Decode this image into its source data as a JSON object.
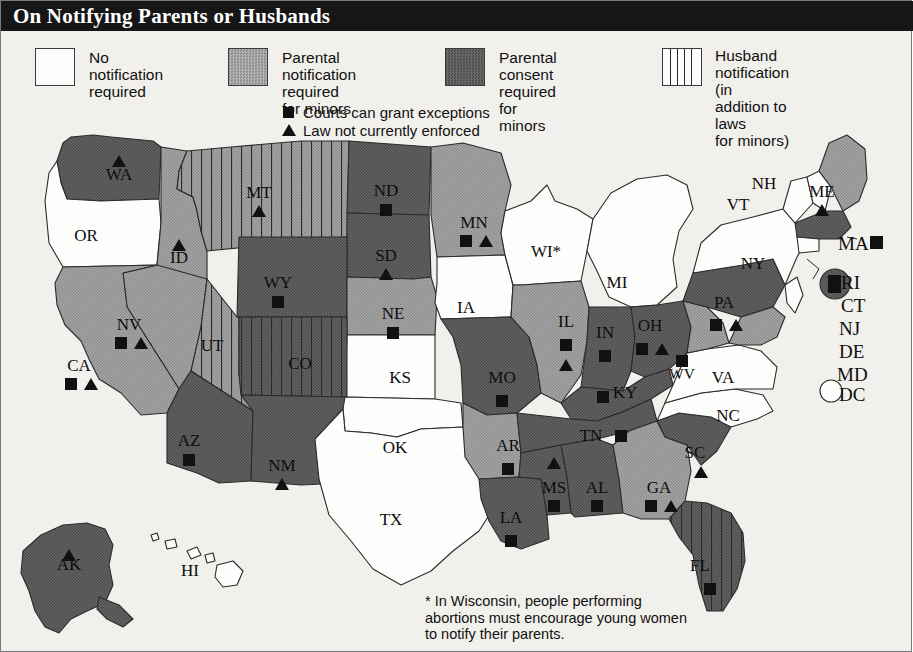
{
  "title": "On Notifying Parents or Husbands",
  "legend": {
    "categories": [
      {
        "id": "none",
        "swatch": "white",
        "line1": "No notification",
        "line2": "required"
      },
      {
        "id": "notify",
        "swatch": "light",
        "line1": "Parental notification",
        "line2": "required for minors"
      },
      {
        "id": "consent",
        "swatch": "dark",
        "line1": "Parental consent",
        "line2": "required for minors"
      },
      {
        "id": "husband",
        "swatch": "stripe",
        "line1": "Husband notification",
        "line2": "(in addition to laws",
        "line3": "for minors)"
      }
    ],
    "markers": [
      {
        "id": "square",
        "icon": "filled-square-icon",
        "label": "Courts can grant exceptions"
      },
      {
        "id": "triangle",
        "icon": "filled-triangle-icon",
        "label": "Law not currently enforced"
      }
    ]
  },
  "colors": {
    "title_bar": "#161616",
    "no_notification": "#fdfdfb",
    "parental_notification": "#9e9e9e",
    "parental_consent": "#5b5b5b",
    "marker": "#111111",
    "background": "#f2f0ec"
  },
  "footnote": "* In Wisconsin, people performing abortions must encourage young women to notify their parents.",
  "map_data": {
    "type": "choropleth-map",
    "region": "United States",
    "states": [
      {
        "code": "WA",
        "category": "consent",
        "markers": [
          "triangle"
        ],
        "x": 118,
        "y": 47
      },
      {
        "code": "OR",
        "category": "none",
        "markers": [],
        "x": 85,
        "y": 108
      },
      {
        "code": "ID",
        "category": "notify",
        "markers": [
          "triangle"
        ],
        "x": 178,
        "y": 130
      },
      {
        "code": "MT",
        "category": "notify",
        "husband": true,
        "markers": [
          "triangle"
        ],
        "x": 258,
        "y": 65
      },
      {
        "code": "ND",
        "category": "consent",
        "markers": [
          "square"
        ],
        "x": 385,
        "y": 63
      },
      {
        "code": "SD",
        "category": "consent",
        "markers": [
          "triangle"
        ],
        "x": 385,
        "y": 128
      },
      {
        "code": "WY",
        "category": "consent",
        "markers": [
          "square"
        ],
        "x": 277,
        "y": 155
      },
      {
        "code": "NV",
        "category": "notify",
        "markers": [
          "square",
          "triangle"
        ],
        "x": 128,
        "y": 197
      },
      {
        "code": "UT",
        "category": "notify",
        "husband": true,
        "markers": [],
        "x": 211,
        "y": 218
      },
      {
        "code": "CO",
        "category": "consent",
        "husband": true,
        "markers": [],
        "x": 299,
        "y": 236
      },
      {
        "code": "NE",
        "category": "notify",
        "markers": [
          "square"
        ],
        "x": 392,
        "y": 186
      },
      {
        "code": "KS",
        "category": "none",
        "markers": [],
        "x": 399,
        "y": 250
      },
      {
        "code": "CA",
        "category": "notify",
        "markers": [
          "square",
          "triangle"
        ],
        "x": 78,
        "y": 238
      },
      {
        "code": "AZ",
        "category": "consent",
        "markers": [
          "square"
        ],
        "x": 188,
        "y": 313
      },
      {
        "code": "NM",
        "category": "consent",
        "markers": [
          "triangle"
        ],
        "x": 281,
        "y": 338
      },
      {
        "code": "TX",
        "category": "none",
        "markers": [],
        "x": 390,
        "y": 392
      },
      {
        "code": "OK",
        "category": "none",
        "markers": [],
        "x": 394,
        "y": 320
      },
      {
        "code": "MN",
        "category": "notify",
        "markers": [
          "square",
          "triangle"
        ],
        "x": 473,
        "y": 95
      },
      {
        "code": "IA",
        "category": "none",
        "markers": [],
        "x": 465,
        "y": 180
      },
      {
        "code": "MO",
        "category": "consent",
        "markers": [
          "square"
        ],
        "x": 501,
        "y": 250
      },
      {
        "code": "AR",
        "category": "notify",
        "markers": [
          "square"
        ],
        "x": 507,
        "y": 318
      },
      {
        "code": "LA",
        "category": "consent",
        "markers": [
          "square"
        ],
        "x": 510,
        "y": 390
      },
      {
        "code": "WI",
        "category": "none",
        "markers": [],
        "asterisk": true,
        "x": 549,
        "y": 124
      },
      {
        "code": "MI",
        "category": "none",
        "markers": [],
        "x": 616,
        "y": 155
      },
      {
        "code": "IL",
        "category": "notify",
        "markers": [
          "square",
          "triangle"
        ],
        "x": 565,
        "y": 194
      },
      {
        "code": "IN",
        "category": "consent",
        "markers": [
          "square"
        ],
        "x": 604,
        "y": 205
      },
      {
        "code": "OH",
        "category": "consent",
        "markers": [
          "square",
          "triangle"
        ],
        "x": 649,
        "y": 198
      },
      {
        "code": "KY",
        "category": "consent",
        "markers": [
          "square"
        ],
        "x": 624,
        "y": 265
      },
      {
        "code": "TN",
        "category": "consent",
        "markers": [
          "square"
        ],
        "x": 590,
        "y": 308
      },
      {
        "code": "MS",
        "category": "consent",
        "markers": [
          "triangle",
          "square"
        ],
        "x": 553,
        "y": 360
      },
      {
        "code": "AL",
        "category": "consent",
        "markers": [
          "square"
        ],
        "x": 596,
        "y": 360
      },
      {
        "code": "GA",
        "category": "notify",
        "markers": [
          "square",
          "triangle"
        ],
        "x": 658,
        "y": 360
      },
      {
        "code": "SC",
        "category": "consent",
        "markers": [
          "triangle"
        ],
        "x": 694,
        "y": 325
      },
      {
        "code": "FL",
        "category": "consent",
        "husband": true,
        "markers": [
          "square"
        ],
        "x": 699,
        "y": 438
      },
      {
        "code": "NC",
        "category": "none",
        "markers": [],
        "x": 727,
        "y": 288
      },
      {
        "code": "VA",
        "category": "none",
        "markers": [],
        "x": 722,
        "y": 250
      },
      {
        "code": "WV",
        "category": "notify",
        "markers": [
          "square"
        ],
        "x": 681,
        "y": 246
      },
      {
        "code": "PA",
        "category": "consent",
        "markers": [
          "square",
          "triangle"
        ],
        "x": 723,
        "y": 175
      },
      {
        "code": "NY",
        "category": "none",
        "markers": [],
        "x": 752,
        "y": 136
      },
      {
        "code": "VT",
        "category": "none",
        "markers": [],
        "x": 737,
        "y": 77
      },
      {
        "code": "NH",
        "category": "none",
        "markers": [],
        "x": 763,
        "y": 56
      },
      {
        "code": "ME",
        "category": "notify",
        "markers": [
          "triangle"
        ],
        "x": 821,
        "y": 64
      },
      {
        "code": "AK",
        "category": "consent",
        "markers": [
          "triangle"
        ],
        "x": 68,
        "y": 437
      },
      {
        "code": "HI",
        "category": "none",
        "markers": [],
        "x": 189,
        "y": 443
      }
    ],
    "callouts": [
      {
        "code": "MA",
        "category": "consent",
        "markers": [
          "square"
        ]
      },
      {
        "code": "RI",
        "category": "consent",
        "markers": [
          "square"
        ]
      },
      {
        "code": "CT",
        "category": "none",
        "markers": []
      },
      {
        "code": "NJ",
        "category": "none",
        "markers": []
      },
      {
        "code": "DE",
        "category": "none",
        "markers": []
      },
      {
        "code": "MD",
        "category": "none",
        "markers": []
      },
      {
        "code": "DC",
        "category": "none",
        "markers": []
      }
    ]
  }
}
